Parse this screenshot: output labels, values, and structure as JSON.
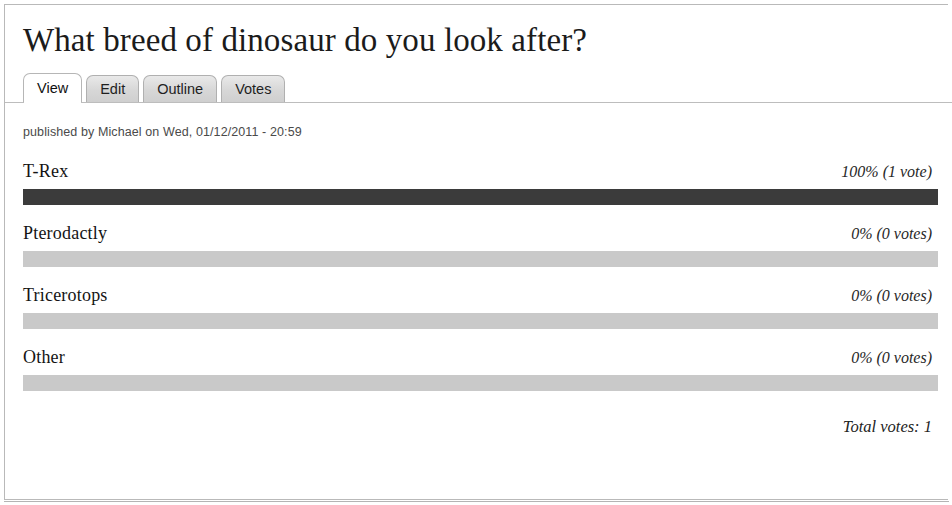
{
  "page": {
    "title": "What breed of dinosaur do you look after?"
  },
  "tabs": [
    {
      "label": "View",
      "active": true
    },
    {
      "label": "Edit",
      "active": false
    },
    {
      "label": "Outline",
      "active": false
    },
    {
      "label": "Votes",
      "active": false
    }
  ],
  "byline": {
    "text": "published by Michael on Wed, 01/12/2011 - 20:59",
    "author": "Michael",
    "date": "Wed, 01/12/2011 - 20:59"
  },
  "poll": {
    "options": [
      {
        "label": "T-Rex",
        "stat": "100% (1 vote)",
        "percent": 100,
        "votes": 1
      },
      {
        "label": "Pterodactly",
        "stat": "0% (0 votes)",
        "percent": 0,
        "votes": 0
      },
      {
        "label": "Tricerotops",
        "stat": "0% (0 votes)",
        "percent": 0,
        "votes": 0
      },
      {
        "label": "Other",
        "stat": "0% (0 votes)",
        "percent": 0,
        "votes": 0
      }
    ],
    "total_votes_label": "Total votes: 1",
    "total_votes": 1
  },
  "colors": {
    "bar_fill": "#3b3b3b",
    "bar_track": "#c9c9c9",
    "tab_active_bg": "#ffffff",
    "tab_inactive_bg": "#d7d7d7",
    "border": "#b9b9b9"
  },
  "chart_data": {
    "type": "bar",
    "title": "What breed of dinosaur do you look after?",
    "categories": [
      "T-Rex",
      "Pterodactly",
      "Tricerotops",
      "Other"
    ],
    "values": [
      100,
      0,
      0,
      0
    ],
    "counts": [
      1,
      0,
      0,
      0
    ],
    "xlabel": "",
    "ylabel": "Percent of votes",
    "ylim": [
      0,
      100
    ],
    "orientation": "horizontal",
    "grid": false,
    "legend": "none",
    "annotations": [
      "100% (1 vote)",
      "0% (0 votes)",
      "0% (0 votes)",
      "0% (0 votes)",
      "Total votes: 1"
    ]
  }
}
